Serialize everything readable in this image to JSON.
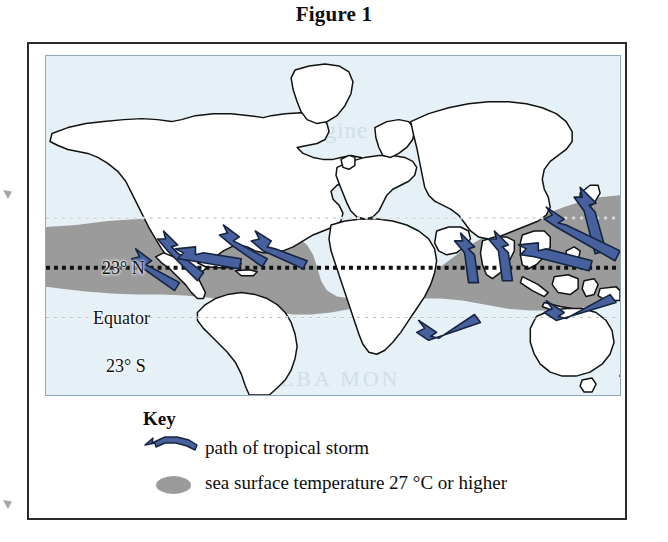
{
  "figure": {
    "title": "Figure 1"
  },
  "map": {
    "ocean_color": "#e6f0f7",
    "land_color": "#ffffff",
    "land_outline_color": "#111111",
    "warm_band_color": "#9b9b9b",
    "arrow_color": "#46619d",
    "arrow_outline_color": "#16243f",
    "latitude_labels": [
      {
        "id": "lat-23n",
        "text": "23° N"
      },
      {
        "id": "lat-equator",
        "text": "Equator"
      },
      {
        "id": "lat-23s",
        "text": "23° S"
      }
    ],
    "ghost_text": [
      "engine",
      "SKY SKY",
      "ALBA MON"
    ]
  },
  "key": {
    "title": "Key",
    "items": [
      {
        "symbol": "blue-curved-arrow",
        "label": "path of tropical storm"
      },
      {
        "symbol": "gray-ellipse",
        "label": "sea surface temperature 27 °C or higher"
      }
    ]
  }
}
